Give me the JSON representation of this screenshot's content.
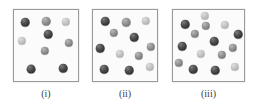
{
  "figure": {
    "width": 257,
    "height": 110,
    "background": "#ffffff"
  },
  "styles": {
    "panel_border": "#9a9a9a",
    "panel_fill": "#fbfbfb",
    "particle_dark": "#3a3a3a",
    "particle_medium": "#8a8a8a",
    "particle_light": "#c2c2c2",
    "label_color": "#3c3c3c"
  },
  "panels": [
    {
      "label": "(i)",
      "box": {
        "x": 13,
        "y": 9,
        "w": 66,
        "h": 73
      },
      "label_box": {
        "x": 13,
        "y": 88,
        "w": 66
      },
      "particle_count": 8,
      "particles": [
        {
          "x": 24,
          "y": 21,
          "r": 4.3,
          "shade": "dark"
        },
        {
          "x": 45,
          "y": 20,
          "r": 4.3,
          "shade": "medium"
        },
        {
          "x": 65,
          "y": 21,
          "r": 4.2,
          "shade": "light"
        },
        {
          "x": 47,
          "y": 33,
          "r": 4.3,
          "shade": "dark"
        },
        {
          "x": 21,
          "y": 40,
          "r": 4.2,
          "shade": "light"
        },
        {
          "x": 68,
          "y": 42,
          "r": 4.2,
          "shade": "medium"
        },
        {
          "x": 44,
          "y": 50,
          "r": 4.2,
          "shade": "medium"
        },
        {
          "x": 30,
          "y": 68,
          "r": 4.4,
          "shade": "dark"
        },
        {
          "x": 62,
          "y": 67,
          "r": 4.3,
          "shade": "dark"
        }
      ]
    },
    {
      "label": "(ii)",
      "box": {
        "x": 92,
        "y": 9,
        "w": 66,
        "h": 73
      },
      "label_box": {
        "x": 92,
        "y": 88,
        "w": 66
      },
      "particle_count": 11,
      "particles": [
        {
          "x": 104,
          "y": 20,
          "r": 4.3,
          "shade": "dark"
        },
        {
          "x": 125,
          "y": 21,
          "r": 4.3,
          "shade": "medium"
        },
        {
          "x": 145,
          "y": 20,
          "r": 4.2,
          "shade": "light"
        },
        {
          "x": 113,
          "y": 32,
          "r": 4.2,
          "shade": "medium"
        },
        {
          "x": 133,
          "y": 36,
          "r": 4.3,
          "shade": "dark"
        },
        {
          "x": 99,
          "y": 47,
          "r": 4.3,
          "shade": "dark"
        },
        {
          "x": 150,
          "y": 46,
          "r": 4.2,
          "shade": "medium"
        },
        {
          "x": 119,
          "y": 53,
          "r": 4.2,
          "shade": "light"
        },
        {
          "x": 138,
          "y": 55,
          "r": 4.2,
          "shade": "medium"
        },
        {
          "x": 103,
          "y": 68,
          "r": 4.3,
          "shade": "dark"
        },
        {
          "x": 128,
          "y": 69,
          "r": 4.3,
          "shade": "dark"
        },
        {
          "x": 149,
          "y": 66,
          "r": 4.2,
          "shade": "light"
        }
      ]
    },
    {
      "label": "(iii)",
      "box": {
        "x": 172,
        "y": 9,
        "w": 73,
        "h": 73
      },
      "label_box": {
        "x": 172,
        "y": 88,
        "w": 73
      },
      "particle_count": 15,
      "particles": [
        {
          "x": 204,
          "y": 15,
          "r": 4.2,
          "shade": "light"
        },
        {
          "x": 184,
          "y": 23,
          "r": 4.3,
          "shade": "dark"
        },
        {
          "x": 205,
          "y": 25,
          "r": 4.2,
          "shade": "medium"
        },
        {
          "x": 224,
          "y": 24,
          "r": 4.2,
          "shade": "light"
        },
        {
          "x": 194,
          "y": 33,
          "r": 4.2,
          "shade": "medium"
        },
        {
          "x": 237,
          "y": 33,
          "r": 4.3,
          "shade": "dark"
        },
        {
          "x": 213,
          "y": 40,
          "r": 4.3,
          "shade": "dark"
        },
        {
          "x": 181,
          "y": 45,
          "r": 4.3,
          "shade": "dark"
        },
        {
          "x": 232,
          "y": 47,
          "r": 4.2,
          "shade": "medium"
        },
        {
          "x": 200,
          "y": 53,
          "r": 4.2,
          "shade": "light"
        },
        {
          "x": 221,
          "y": 54,
          "r": 4.2,
          "shade": "medium"
        },
        {
          "x": 178,
          "y": 62,
          "r": 4.2,
          "shade": "medium"
        },
        {
          "x": 192,
          "y": 68,
          "r": 4.3,
          "shade": "dark"
        },
        {
          "x": 214,
          "y": 69,
          "r": 4.3,
          "shade": "dark"
        },
        {
          "x": 234,
          "y": 66,
          "r": 4.2,
          "shade": "light"
        }
      ]
    }
  ]
}
